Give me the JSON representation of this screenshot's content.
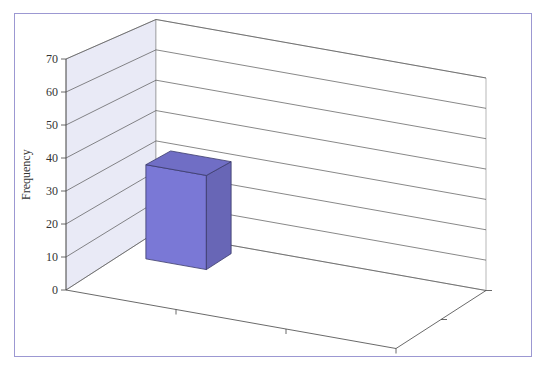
{
  "chart_data": {
    "type": "bar",
    "variant": "3d-clustered-depth",
    "title": "",
    "xlabel": "",
    "ylabel": "Frequency",
    "ylim": [
      0,
      70
    ],
    "yticks": [
      "0",
      "10",
      "20",
      "30",
      "40",
      "50",
      "60",
      "70"
    ],
    "categories": [
      "Whistle",
      "Opportunism",
      "Reciprocate"
    ],
    "series": [
      {
        "name": "Male students in Passau",
        "values": [
          20,
          39,
          22
        ],
        "color": "#c3c3f0"
      },
      {
        "name": "Female students in Passau",
        "values": [
          30,
          66,
          3
        ],
        "color": "#7a78d6"
      }
    ],
    "depth_labels": [
      [
        "Female students",
        "in Passau"
      ],
      [
        "Male students",
        "in Passau"
      ]
    ],
    "grid": true,
    "legend_position": "depth-axis-right"
  },
  "colors": {
    "frame": "#9c98d2",
    "axis": "#444444",
    "wall_left": "#e9eaf6",
    "male": "#c3c3f0",
    "female": "#7a78d6"
  }
}
